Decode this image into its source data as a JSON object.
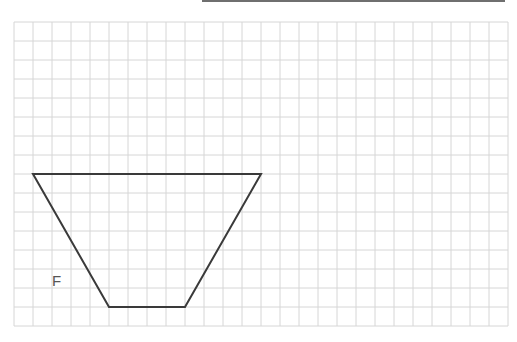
{
  "colors": {
    "grid": "#d6d6d6",
    "outline": "#3a3a3a",
    "label": "#555555",
    "top_bar": "#6f6f6f"
  },
  "grid": {
    "columns": 26,
    "rows": 16
  },
  "shape": {
    "type": "trapezoid",
    "label": "F",
    "vertices_grid_units": [
      [
        1,
        8
      ],
      [
        13,
        8
      ],
      [
        9,
        15
      ],
      [
        5,
        15
      ]
    ]
  }
}
